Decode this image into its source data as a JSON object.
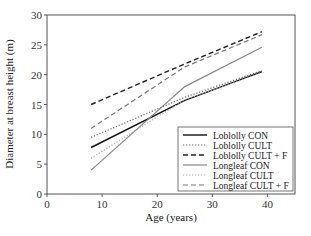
{
  "chart_data": {
    "type": "line",
    "title": "",
    "xlabel": "Age (years)",
    "ylabel": "Diameter at breast height (m)",
    "xlim": [
      0,
      45
    ],
    "ylim": [
      0,
      30
    ],
    "xticks": [
      0,
      10,
      20,
      30,
      40
    ],
    "yticks": [
      0,
      5,
      10,
      15,
      20,
      25,
      30
    ],
    "grid": false,
    "legend_position": "lower right",
    "x": [
      8,
      25,
      39
    ],
    "series": [
      {
        "name": "Loblolly CON",
        "values": [
          7.8,
          15.7,
          20.5
        ],
        "color": "#111111",
        "dash": "solid",
        "width": 1.4
      },
      {
        "name": "Loblolly CULT",
        "values": [
          9.5,
          16.2,
          20.7
        ],
        "color": "#666666",
        "dash": "dotted",
        "width": 1.2
      },
      {
        "name": "Loblolly CULT + F",
        "values": [
          15.0,
          21.8,
          27.2
        ],
        "color": "#222222",
        "dash": "dashed",
        "width": 1.4
      },
      {
        "name": "Longleaf CON",
        "values": [
          4.0,
          18.0,
          24.6
        ],
        "color": "#888888",
        "dash": "solid",
        "width": 1.2
      },
      {
        "name": "Longleaf CULT",
        "values": [
          6.0,
          15.8,
          20.4
        ],
        "color": "#aaaaaa",
        "dash": "dotted",
        "width": 1.2
      },
      {
        "name": "Longleaf CULT + F",
        "values": [
          11.0,
          21.3,
          26.7
        ],
        "color": "#777777",
        "dash": "dashed",
        "width": 1.2
      }
    ]
  },
  "legend": {
    "items": [
      "Loblolly CON",
      "Loblolly CULT",
      "Loblolly CULT + F",
      "Longleaf CON",
      "Longleaf CULT",
      "Longleaf CULT + F"
    ]
  },
  "axes": {
    "xlabel": "Age (years)",
    "ylabel": "Diameter at breast height (m)"
  }
}
